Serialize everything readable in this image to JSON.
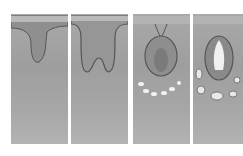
{
  "figure": {
    "panels": [
      {
        "stage": "bud",
        "x": 11,
        "width": 57
      },
      {
        "stage": "cap",
        "x": 71,
        "width": 57
      },
      {
        "stage": "bell",
        "x": 133,
        "width": 57
      },
      {
        "stage": "crown",
        "x": 193,
        "width": 50
      }
    ],
    "colors": {
      "tissue": "#a6a6a6",
      "epithelium": "#7d7d7d",
      "outline": "#555555",
      "highlight": "#f2f2f2"
    }
  }
}
